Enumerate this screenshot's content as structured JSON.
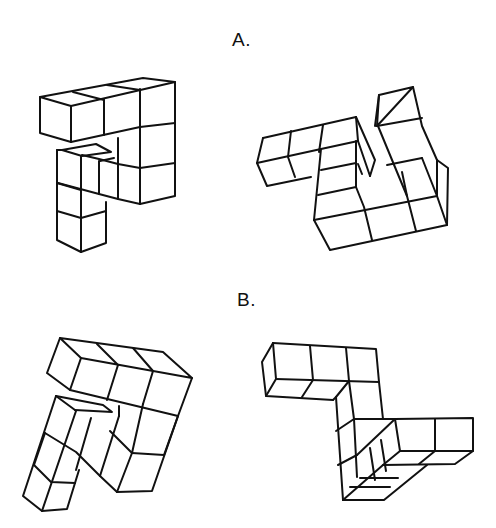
{
  "figure": {
    "type": "mental-rotation-test",
    "pairs": [
      {
        "label": "A.",
        "left": {
          "name": "cube-figure-a-left",
          "cube_count": 10
        },
        "right": {
          "name": "cube-figure-a-right",
          "cube_count": 10
        }
      },
      {
        "label": "B.",
        "left": {
          "name": "cube-figure-b-left",
          "cube_count": 10
        },
        "right": {
          "name": "cube-figure-b-right",
          "cube_count": 10
        }
      }
    ]
  },
  "colors": {
    "stroke": "#111111",
    "background": "#ffffff"
  }
}
